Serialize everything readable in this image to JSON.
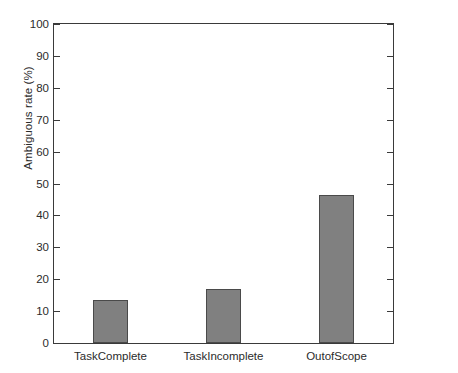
{
  "chart_data": {
    "type": "bar",
    "title": "",
    "xlabel": "",
    "ylabel": "Ambiguous rate (%)",
    "categories": [
      "TaskComplete",
      "TaskIncomplete",
      "OutofScope"
    ],
    "values": [
      13.4,
      16.9,
      46.5
    ],
    "ylim": [
      0,
      100
    ],
    "yticks": [
      0,
      10,
      20,
      30,
      40,
      50,
      60,
      70,
      80,
      90,
      100
    ],
    "ytick_labels": [
      "0",
      "10",
      "20",
      "30",
      "40",
      "50",
      "60",
      "70",
      "80",
      "90",
      "100"
    ],
    "grid": false,
    "legend": null,
    "bar_color": "#808080",
    "bar_edge_color": "#4a4a4a",
    "axis_color": "#3a3a3a",
    "background_color": "#ffffff"
  }
}
